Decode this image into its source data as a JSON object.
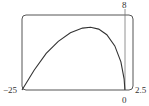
{
  "chart_data": {
    "type": "line",
    "title": "",
    "xlabel": "",
    "ylabel": "",
    "xlim": [
      -25,
      2.5
    ],
    "ylim": [
      0,
      8
    ],
    "grid": false,
    "legend": null,
    "tick_labels": {
      "x_left": "−25",
      "x_right": "2.5",
      "x_zero": "0",
      "y_top": "8"
    },
    "series": [
      {
        "name": "curve",
        "x": [
          -25,
          -22,
          -19,
          -16,
          -13,
          -10,
          -8,
          -6,
          -4,
          -2,
          -0.5,
          0.3,
          0.5
        ],
        "y": [
          0,
          2.1,
          3.9,
          5.2,
          6.1,
          6.6,
          6.7,
          6.5,
          5.9,
          4.7,
          3.0,
          1.2,
          0
        ]
      }
    ],
    "colors": {
      "curve": "#333333",
      "frame": "#555555",
      "axis": "#777777"
    }
  }
}
